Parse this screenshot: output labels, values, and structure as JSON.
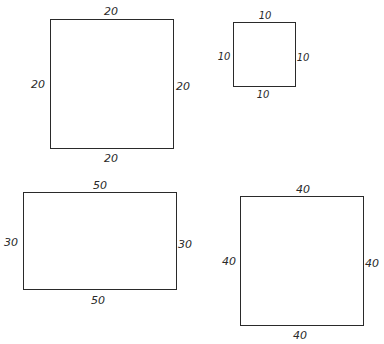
{
  "diagram": {
    "shapes": [
      {
        "name": "square-20",
        "type": "square",
        "top": "20",
        "left": "20",
        "right": "20",
        "bottom": "20"
      },
      {
        "name": "square-10",
        "type": "square",
        "top": "10",
        "left": "10",
        "right": "10",
        "bottom": "10"
      },
      {
        "name": "rectangle-50x30",
        "type": "rectangle",
        "top": "50",
        "left": "30",
        "right": "30",
        "bottom": "50"
      },
      {
        "name": "square-40",
        "type": "square",
        "top": "40",
        "left": "40",
        "right": "40",
        "bottom": "40"
      }
    ]
  }
}
